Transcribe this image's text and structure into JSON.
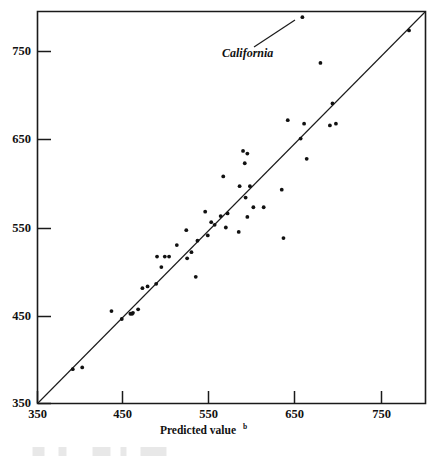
{
  "figure": {
    "background_color": "#ffffff",
    "ink_color": "#111111"
  },
  "axis": {
    "x_title": "Predicted value",
    "x_title_superscript": "b",
    "x_ticks": [
      "350",
      "450",
      "550",
      "650",
      "750"
    ],
    "y_ticks": [
      "350",
      "450",
      "550",
      "650",
      "750"
    ]
  },
  "annotations": {
    "california_label": "California"
  },
  "chart_data": {
    "type": "scatter",
    "title": "",
    "xlabel": "Predicted value",
    "xlabel_superscript": "b",
    "ylabel": "",
    "xlim": [
      350,
      800
    ],
    "ylim": [
      350,
      800
    ],
    "xticks": [
      350,
      450,
      550,
      650,
      750
    ],
    "yticks": [
      350,
      450,
      550,
      650,
      750
    ],
    "grid": false,
    "legend": null,
    "reference_line": {
      "description": "45-degree identity line y = x",
      "from": [
        350,
        350
      ],
      "to": [
        800,
        800
      ]
    },
    "annotations": [
      {
        "text": "California",
        "style": "italic",
        "points_to_x": 658,
        "points_to_y": 789,
        "label_x": 568,
        "label_y": 755
      }
    ],
    "points": [
      {
        "x": 658,
        "y": 789,
        "label": "California"
      },
      {
        "x": 782,
        "y": 774
      },
      {
        "x": 679,
        "y": 737
      },
      {
        "x": 693,
        "y": 691
      },
      {
        "x": 641,
        "y": 672
      },
      {
        "x": 660,
        "y": 668
      },
      {
        "x": 690,
        "y": 666
      },
      {
        "x": 697,
        "y": 668
      },
      {
        "x": 656,
        "y": 651
      },
      {
        "x": 589,
        "y": 637
      },
      {
        "x": 594,
        "y": 634
      },
      {
        "x": 663,
        "y": 628
      },
      {
        "x": 591,
        "y": 623
      },
      {
        "x": 566,
        "y": 608
      },
      {
        "x": 585,
        "y": 597
      },
      {
        "x": 597,
        "y": 597
      },
      {
        "x": 634,
        "y": 593
      },
      {
        "x": 592,
        "y": 584
      },
      {
        "x": 601,
        "y": 573
      },
      {
        "x": 613,
        "y": 573
      },
      {
        "x": 545,
        "y": 568
      },
      {
        "x": 571,
        "y": 566
      },
      {
        "x": 563,
        "y": 563
      },
      {
        "x": 594,
        "y": 562
      },
      {
        "x": 552,
        "y": 556
      },
      {
        "x": 556,
        "y": 553
      },
      {
        "x": 569,
        "y": 550
      },
      {
        "x": 523,
        "y": 547
      },
      {
        "x": 584,
        "y": 545
      },
      {
        "x": 548,
        "y": 541
      },
      {
        "x": 636,
        "y": 538
      },
      {
        "x": 536,
        "y": 535
      },
      {
        "x": 512,
        "y": 530
      },
      {
        "x": 529,
        "y": 522
      },
      {
        "x": 489,
        "y": 517
      },
      {
        "x": 498,
        "y": 517
      },
      {
        "x": 503,
        "y": 517
      },
      {
        "x": 524,
        "y": 515
      },
      {
        "x": 494,
        "y": 505
      },
      {
        "x": 534,
        "y": 494
      },
      {
        "x": 488,
        "y": 486
      },
      {
        "x": 478,
        "y": 483
      },
      {
        "x": 472,
        "y": 481
      },
      {
        "x": 467,
        "y": 457
      },
      {
        "x": 436,
        "y": 455
      },
      {
        "x": 461,
        "y": 453
      },
      {
        "x": 460,
        "y": 452
      },
      {
        "x": 458,
        "y": 452
      },
      {
        "x": 448,
        "y": 446
      },
      {
        "x": 402,
        "y": 391
      },
      {
        "x": 391,
        "y": 389
      }
    ]
  }
}
